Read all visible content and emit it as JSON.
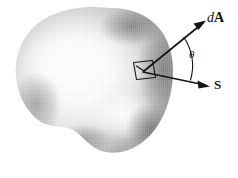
{
  "figure": {
    "kind": "physics-vector-diagram",
    "background_color": "#ffffff",
    "ink_color": "#141414",
    "width": 238,
    "height": 178,
    "surface": {
      "name": "closed-irregular-surface",
      "style": "airbrushed-grayscale-halftone",
      "shade_dark": "#6b6b6b",
      "shade_mid": "#a8a8a8",
      "shade_light": "#f2f2f2",
      "highlight_color": "#ffffff"
    },
    "patch": {
      "name": "area-element-patch",
      "description": "small quadrilateral area element on the surface"
    },
    "vectors": [
      {
        "id": "dA",
        "label_italic": "d",
        "label_bold": "A",
        "meaning": "outward area normal vector",
        "direction": "up-right"
      },
      {
        "id": "S",
        "label_bold": "S",
        "meaning": "Poynting vector",
        "direction": "down-right"
      }
    ],
    "angle": {
      "id": "theta",
      "symbol": "θ",
      "meaning": "angle between dA and S"
    }
  }
}
